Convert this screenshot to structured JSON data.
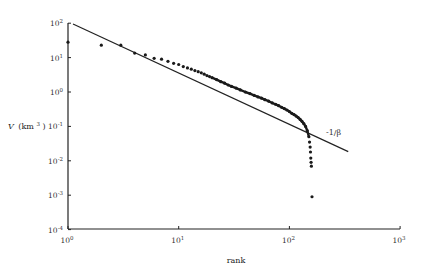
{
  "chart_data": {
    "type": "scatter",
    "title": "",
    "xlabel": "rank",
    "ylabel_main": "V",
    "ylabel_unit": "(km",
    "ylabel_sup": "3",
    "ylabel_close": ")",
    "xscale": "log",
    "yscale": "log",
    "xlim": [
      1,
      1000
    ],
    "ylim": [
      0.0001,
      100
    ],
    "grid": false,
    "legend": null,
    "x_ticks": [
      {
        "base": "10",
        "exp": "0",
        "value": 1
      },
      {
        "base": "10",
        "exp": "1",
        "value": 10
      },
      {
        "base": "10",
        "exp": "2",
        "value": 100
      },
      {
        "base": "10",
        "exp": "3",
        "value": 1000
      }
    ],
    "y_ticks": [
      {
        "base": "10",
        "exp": "2",
        "value": 100
      },
      {
        "base": "10",
        "exp": "1",
        "value": 10
      },
      {
        "base": "10",
        "exp": "0",
        "value": 1
      },
      {
        "base": "10",
        "exp": "-1",
        "value": 0.1
      },
      {
        "base": "10",
        "exp": "-2",
        "value": 0.01
      },
      {
        "base": "10",
        "exp": "-3",
        "value": 0.001
      },
      {
        "base": "10",
        "exp": "-4",
        "value": 0.0001
      }
    ],
    "series": [
      {
        "name": "observed volumes",
        "style": "dots",
        "points": [
          [
            1,
            28
          ],
          [
            2,
            23
          ],
          [
            3,
            23
          ],
          [
            4,
            13.5
          ],
          [
            5,
            12
          ],
          [
            6,
            9.5
          ],
          [
            7,
            9
          ],
          [
            8,
            7.8
          ],
          [
            9,
            6.8
          ],
          [
            10,
            6.3
          ],
          [
            11,
            5.5
          ],
          [
            12,
            5.0
          ],
          [
            13,
            4.6
          ],
          [
            14,
            4.2
          ],
          [
            15,
            3.9
          ],
          [
            16,
            3.6
          ],
          [
            17,
            3.3
          ],
          [
            18,
            3.0
          ],
          [
            19,
            2.8
          ],
          [
            20,
            2.6
          ],
          [
            22,
            2.3
          ],
          [
            24,
            2.0
          ],
          [
            26,
            1.8
          ],
          [
            28,
            1.6
          ],
          [
            30,
            1.45
          ],
          [
            33,
            1.3
          ],
          [
            36,
            1.15
          ],
          [
            40,
            1.0
          ],
          [
            44,
            0.9
          ],
          [
            48,
            0.8
          ],
          [
            52,
            0.72
          ],
          [
            56,
            0.66
          ],
          [
            60,
            0.6
          ],
          [
            65,
            0.54
          ],
          [
            70,
            0.48
          ],
          [
            75,
            0.44
          ],
          [
            80,
            0.4
          ],
          [
            85,
            0.36
          ],
          [
            90,
            0.33
          ],
          [
            95,
            0.3
          ],
          [
            100,
            0.27
          ],
          [
            105,
            0.24
          ],
          [
            110,
            0.22
          ],
          [
            115,
            0.2
          ],
          [
            120,
            0.18
          ],
          [
            125,
            0.16
          ],
          [
            130,
            0.14
          ],
          [
            135,
            0.12
          ],
          [
            140,
            0.1
          ],
          [
            145,
            0.075
          ],
          [
            150,
            0.05
          ],
          [
            152,
            0.035
          ],
          [
            154,
            0.025
          ],
          [
            155,
            0.018
          ],
          [
            156,
            0.012
          ],
          [
            157,
            0.009
          ],
          [
            158,
            0.007
          ],
          [
            160,
            0.0009
          ]
        ]
      },
      {
        "name": "power-law fit",
        "style": "line",
        "label": "-1/β",
        "points": [
          [
            1.11,
            95
          ],
          [
            340,
            0.0185
          ]
        ]
      }
    ]
  },
  "annotation": "-1/β"
}
